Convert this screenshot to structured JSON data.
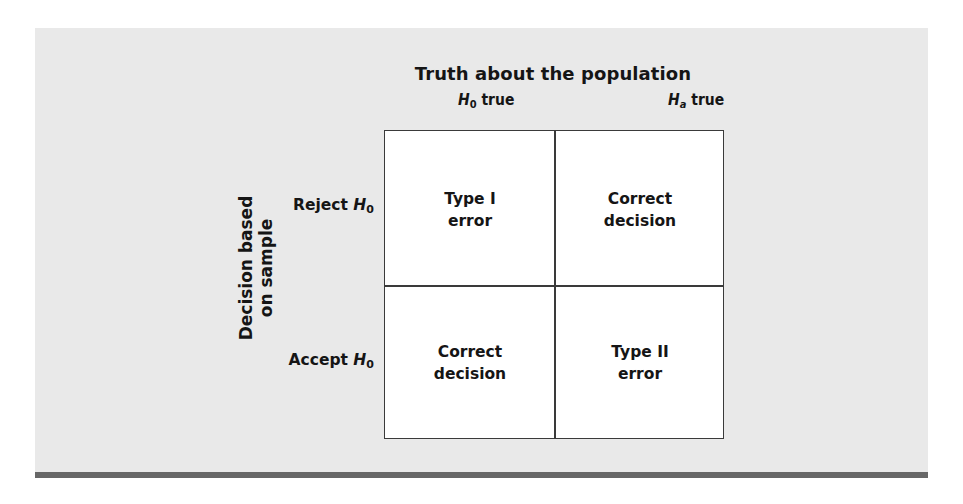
{
  "diagram": {
    "type": "decision-error-matrix",
    "title": "Truth about the population",
    "side_label": [
      "Decision based",
      "on sample"
    ],
    "columns": [
      {
        "symbol": "H",
        "subscript": "0",
        "suffix": " true"
      },
      {
        "symbol": "H",
        "subscript": "a",
        "suffix": " true"
      }
    ],
    "rows": [
      {
        "prefix": "Reject ",
        "symbol": "H",
        "subscript": "0"
      },
      {
        "prefix": "Accept ",
        "symbol": "H",
        "subscript": "0"
      }
    ],
    "cells": [
      [
        [
          "Type I",
          "error"
        ],
        [
          "Correct",
          "decision"
        ]
      ],
      [
        [
          "Correct",
          "decision"
        ],
        [
          "Type II",
          "error"
        ]
      ]
    ]
  },
  "colors": {
    "panel_background": "#e9e9e9",
    "bottom_bar": "#676767",
    "grid_fill": "#ffffff",
    "grid_line": "#3a3a3a"
  }
}
